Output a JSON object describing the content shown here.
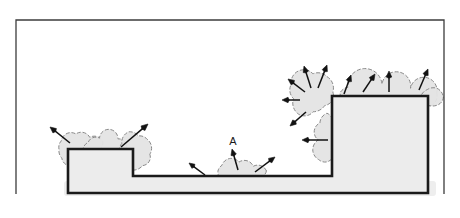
{
  "figure": {
    "caption": "",
    "background_color": "#ffffff"
  },
  "frame": {
    "name": "outer-border",
    "x": 16,
    "y": 20,
    "width": 428,
    "height": 174,
    "stroke_color": "#3c3c3c",
    "stroke_width": 1.3,
    "fill": "none",
    "bottom_open": true
  },
  "colors": {
    "substrate_fill": "#ececec",
    "substrate_stroke": "#1a1a1a",
    "cloud_fill": "#e4e4e4",
    "cloud_stroke": "#8a8a8a",
    "arrow_color": "#121212",
    "shadow_fill": "#eeeeee",
    "label_color": "#1a1a1a",
    "frame_color": "#3c3c3c"
  },
  "substrate": {
    "name": "stepped-substrate",
    "stroke_width": 2.6,
    "profile_description": "Left low mesa, deep middle trench, tall right mesa",
    "points": [
      [
        68,
        193
      ],
      [
        68,
        149
      ],
      [
        133,
        149
      ],
      [
        133,
        176
      ],
      [
        332,
        176
      ],
      [
        332,
        96
      ],
      [
        428,
        96
      ],
      [
        428,
        193
      ]
    ],
    "shadow": {
      "name": "substrate-shadow",
      "x": 64,
      "y": 181,
      "width": 372,
      "height": 15,
      "fill": "#eeeeee"
    }
  },
  "labels": [
    {
      "name": "point-label-a",
      "text": "A",
      "x": 233,
      "y": 145,
      "font_size": 11
    }
  ],
  "clouds": [
    {
      "name": "cloud-left-mesa-topleft",
      "center_x": 78,
      "center_y": 146,
      "lobe_radius": 9,
      "lobe_count": 8,
      "spread_x": 22,
      "spread_y": 11,
      "rotation": -10
    },
    {
      "name": "cloud-left-mesa-topsurface",
      "center_x": 104,
      "center_y": 145,
      "lobe_radius": 8,
      "lobe_count": 7,
      "spread_x": 20,
      "spread_y": 7,
      "rotation": 0
    },
    {
      "name": "cloud-left-mesa-topright",
      "center_x": 134,
      "center_y": 152,
      "lobe_radius": 10,
      "lobe_count": 9,
      "spread_x": 14,
      "spread_y": 20,
      "rotation": 8
    },
    {
      "name": "cloud-trench-feature-a",
      "center_x": 239,
      "center_y": 171,
      "lobe_radius": 9,
      "lobe_count": 8,
      "spread_x": 24,
      "spread_y": 8,
      "rotation": 0
    },
    {
      "name": "cloud-right-mesa-upperleft",
      "center_x": 310,
      "center_y": 92,
      "lobe_radius": 12,
      "lobe_count": 9,
      "spread_x": 20,
      "spread_y": 22,
      "rotation": 0
    },
    {
      "name": "cloud-right-mesa-sidewall",
      "center_x": 327,
      "center_y": 140,
      "lobe_radius": 10,
      "lobe_count": 8,
      "spread_x": 10,
      "spread_y": 24,
      "rotation": 0
    },
    {
      "name": "cloud-right-mesa-topsurface",
      "center_x": 382,
      "center_y": 93,
      "lobe_radius": 11,
      "lobe_count": 8,
      "spread_x": 48,
      "spread_y": 8,
      "rotation": 0
    },
    {
      "name": "cloud-right-mesa-topright",
      "center_x": 432,
      "center_y": 97,
      "lobe_radius": 11,
      "lobe_count": 6,
      "spread_x": 10,
      "spread_y": 10,
      "rotation": 0
    }
  ],
  "arrows": [
    {
      "name": "flux-arrow-1",
      "x1": 70,
      "y1": 143,
      "x2": 50,
      "y2": 127,
      "head": 6.0
    },
    {
      "name": "flux-arrow-2",
      "x1": 121,
      "y1": 147,
      "x2": 148,
      "y2": 124,
      "head": 6.5
    },
    {
      "name": "flux-arrow-3",
      "x1": 205,
      "y1": 175,
      "x2": 189,
      "y2": 163,
      "head": 5.5
    },
    {
      "name": "flux-arrow-4",
      "x1": 238,
      "y1": 170,
      "x2": 232,
      "y2": 149,
      "head": 6.0
    },
    {
      "name": "flux-arrow-5",
      "x1": 255,
      "y1": 172,
      "x2": 275,
      "y2": 157,
      "head": 6.0
    },
    {
      "name": "flux-arrow-6",
      "x1": 328,
      "y1": 140,
      "x2": 302,
      "y2": 140,
      "head": 6.0
    },
    {
      "name": "flux-arrow-7",
      "x1": 306,
      "y1": 112,
      "x2": 290,
      "y2": 126,
      "head": 6.0
    },
    {
      "name": "flux-arrow-8",
      "x1": 300,
      "y1": 100,
      "x2": 282,
      "y2": 100,
      "head": 6.0
    },
    {
      "name": "flux-arrow-9",
      "x1": 305,
      "y1": 92,
      "x2": 288,
      "y2": 79,
      "head": 6.0
    },
    {
      "name": "flux-arrow-10",
      "x1": 311,
      "y1": 88,
      "x2": 304,
      "y2": 66,
      "head": 6.0
    },
    {
      "name": "flux-arrow-11",
      "x1": 318,
      "y1": 88,
      "x2": 327,
      "y2": 65,
      "head": 6.0
    },
    {
      "name": "flux-arrow-12",
      "x1": 344,
      "y1": 94,
      "x2": 351,
      "y2": 75,
      "head": 6.0
    },
    {
      "name": "flux-arrow-13",
      "x1": 363,
      "y1": 92,
      "x2": 375,
      "y2": 74,
      "head": 6.0
    },
    {
      "name": "flux-arrow-14",
      "x1": 389,
      "y1": 92,
      "x2": 389,
      "y2": 71,
      "head": 6.0
    },
    {
      "name": "flux-arrow-15",
      "x1": 419,
      "y1": 90,
      "x2": 428,
      "y2": 69,
      "head": 6.0
    }
  ]
}
